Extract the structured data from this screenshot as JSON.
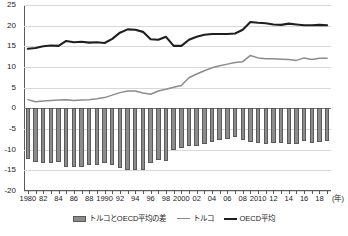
{
  "chart_data": {
    "type": "bar",
    "title": "",
    "xlabel": "年",
    "ylabel": "",
    "ylim": [
      -20,
      25
    ],
    "ytick_values": [
      25,
      20,
      15,
      10,
      5,
      0,
      -5,
      -10,
      -15,
      -20
    ],
    "ytick_labels": [
      "25",
      "20",
      "15",
      "10",
      "5",
      "0",
      "-5",
      "-10",
      "-15",
      "-20"
    ],
    "grid": true,
    "legend_position": "bottom",
    "x": [
      1980,
      1981,
      1982,
      1983,
      1984,
      1985,
      1986,
      1987,
      1988,
      1989,
      1990,
      1991,
      1992,
      1993,
      1994,
      1995,
      1996,
      1997,
      1998,
      1999,
      2000,
      2001,
      2002,
      2003,
      2004,
      2005,
      2006,
      2007,
      2008,
      2009,
      2010,
      2011,
      2012,
      2013,
      2014,
      2015,
      2016,
      2017,
      2018,
      2019
    ],
    "xtick_labels": [
      "1980",
      "82",
      "84",
      "86",
      "88",
      "1990",
      "92",
      "94",
      "96",
      "98",
      "2000",
      "02",
      "04",
      "06",
      "08",
      "2010",
      "12",
      "14",
      "16",
      "18"
    ],
    "xtick_years": [
      1980,
      1982,
      1984,
      1986,
      1988,
      1990,
      1992,
      1994,
      1996,
      1998,
      2000,
      2002,
      2004,
      2006,
      2008,
      2010,
      2012,
      2014,
      2016,
      2018
    ],
    "unit_annotation": "(年)",
    "series": [
      {
        "name": "トルコとOECD平均の差",
        "type": "bar",
        "color": "#8c8c8c",
        "values": [
          -12.3,
          -13.0,
          -13.2,
          -13.3,
          -13.1,
          -14.2,
          -14.1,
          -14.1,
          -13.8,
          -13.7,
          -13.2,
          -13.6,
          -14.5,
          -14.9,
          -14.8,
          -14.8,
          -13.3,
          -12.4,
          -12.7,
          -10.0,
          -9.6,
          -9.2,
          -9.0,
          -8.7,
          -8.2,
          -7.7,
          -7.3,
          -7.0,
          -7.7,
          -8.1,
          -8.5,
          -8.6,
          -8.3,
          -8.3,
          -8.7,
          -8.7,
          -7.9,
          -8.3,
          -8.1,
          -8.0
        ]
      },
      {
        "name": "トルコ",
        "type": "line",
        "color": "#8c8c8c",
        "values": [
          2.1,
          1.6,
          1.8,
          1.9,
          2.0,
          2.1,
          1.9,
          2.0,
          2.1,
          2.3,
          2.6,
          3.2,
          3.8,
          4.2,
          4.2,
          3.7,
          3.4,
          4.2,
          4.6,
          5.1,
          5.5,
          7.4,
          8.3,
          9.1,
          9.8,
          10.3,
          10.7,
          11.1,
          11.3,
          12.8,
          12.2,
          12.0,
          12.0,
          11.9,
          11.8,
          11.6,
          12.2,
          11.8,
          12.1,
          12.1
        ]
      },
      {
        "name": "OECD平均",
        "type": "line",
        "color": "#1f1f1f",
        "values": [
          14.4,
          14.6,
          15.0,
          15.2,
          15.1,
          16.3,
          16.0,
          16.1,
          15.9,
          16.0,
          15.8,
          16.8,
          18.3,
          19.1,
          19.0,
          18.5,
          16.7,
          16.6,
          17.3,
          15.1,
          15.1,
          16.6,
          17.3,
          17.8,
          18.0,
          18.0,
          18.0,
          18.1,
          19.0,
          20.9,
          20.7,
          20.6,
          20.3,
          20.2,
          20.5,
          20.3,
          20.1,
          20.1,
          20.2,
          20.1
        ]
      }
    ]
  }
}
